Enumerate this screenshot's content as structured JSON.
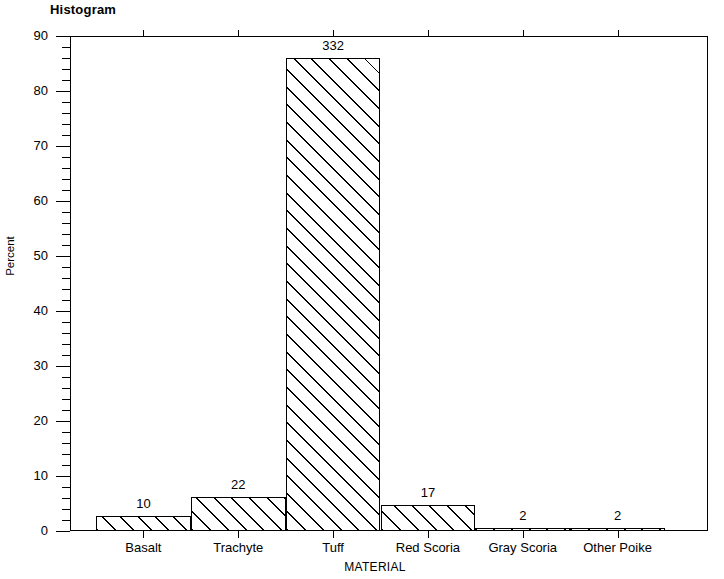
{
  "chart_data": {
    "type": "bar",
    "title": "Histogram",
    "xlabel": "MATERIAL",
    "ylabel": "Percent",
    "categories": [
      "Basalt",
      "Trachyte",
      "Tuff",
      "Red Scoria",
      "Gray Scoria",
      "Other Poike"
    ],
    "values": [
      2.7,
      6.2,
      86.0,
      4.7,
      0.5,
      0.5
    ],
    "counts": [
      10,
      22,
      332,
      17,
      2,
      2
    ],
    "bar_labels": [
      "10",
      "22",
      "332",
      "17",
      "2",
      "2"
    ],
    "ylim": [
      0,
      90
    ],
    "ytick_labels": [
      "0",
      "10",
      "20",
      "30",
      "40",
      "50",
      "60",
      "70",
      "80",
      "90"
    ],
    "ytick_values": [
      0,
      10,
      20,
      30,
      40,
      50,
      60,
      70,
      80,
      90
    ],
    "yminor_step": 2,
    "grid": false,
    "legend": false,
    "series_name": "Percent",
    "fill": "diagonal-hatch",
    "outline_color": "#000000",
    "background_color": "#ffffff"
  }
}
